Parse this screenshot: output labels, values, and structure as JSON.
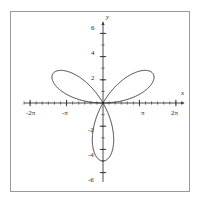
{
  "figure": {
    "frame_color": "#9a9a9a",
    "background": "#ffffff",
    "curve_color": "#1a1a1a",
    "axis_color": "#3a3a3a",
    "x_axis_name": "x",
    "y_axis_name": "y"
  },
  "chart_data": {
    "type": "line",
    "title": "",
    "xlabel": "x",
    "ylabel": "y",
    "grid": false,
    "legend": null,
    "xlim": [
      -7.2,
      7.2
    ],
    "ylim": [
      -7.2,
      7.2
    ],
    "curve_equation": "r = 5 sin(3θ)",
    "petal_max_radius": 5,
    "x_ticks": [
      -6.2832,
      -3.1416,
      3.1416,
      6.2832
    ],
    "x_tick_labels": [
      "-2π",
      "-π",
      "π",
      "2π"
    ],
    "x_minor_tick_step": 0.5236,
    "y_ticks": [
      -6,
      -4,
      -2,
      2,
      4,
      6
    ],
    "y_tick_labels": [
      "-6",
      "-4",
      "-2",
      "2",
      "4",
      "6"
    ],
    "y_minor_tick_step": 1,
    "petals": [
      {
        "name": "lower-petal",
        "tip_x": 0.0,
        "tip_y": -5.0,
        "tip_angle_deg": 270
      },
      {
        "name": "upper-left-petal",
        "tip_x": -4.33,
        "tip_y": 2.5,
        "tip_angle_deg": 150
      },
      {
        "name": "upper-right-petal",
        "tip_x": 4.33,
        "tip_y": 2.5,
        "tip_angle_deg": 30
      }
    ]
  },
  "axis_labels": {
    "x": [
      {
        "text": "-2π",
        "px": 26,
        "py": 110
      },
      {
        "text": "-π",
        "px": 62,
        "py": 110
      },
      {
        "text": "π",
        "px": 141,
        "py": 110
      },
      {
        "text": "2π",
        "px": 171,
        "py": 110
      }
    ],
    "y": [
      {
        "text": "6",
        "px": 91,
        "py": 25
      },
      {
        "text": "4",
        "px": 91,
        "py": 50
      },
      {
        "text": "2",
        "px": 91,
        "py": 75
      },
      {
        "text": "-2",
        "px": 88,
        "py": 127
      },
      {
        "text": "-4",
        "px": 88,
        "py": 152
      },
      {
        "text": "-6",
        "px": 88,
        "py": 177
      }
    ]
  }
}
